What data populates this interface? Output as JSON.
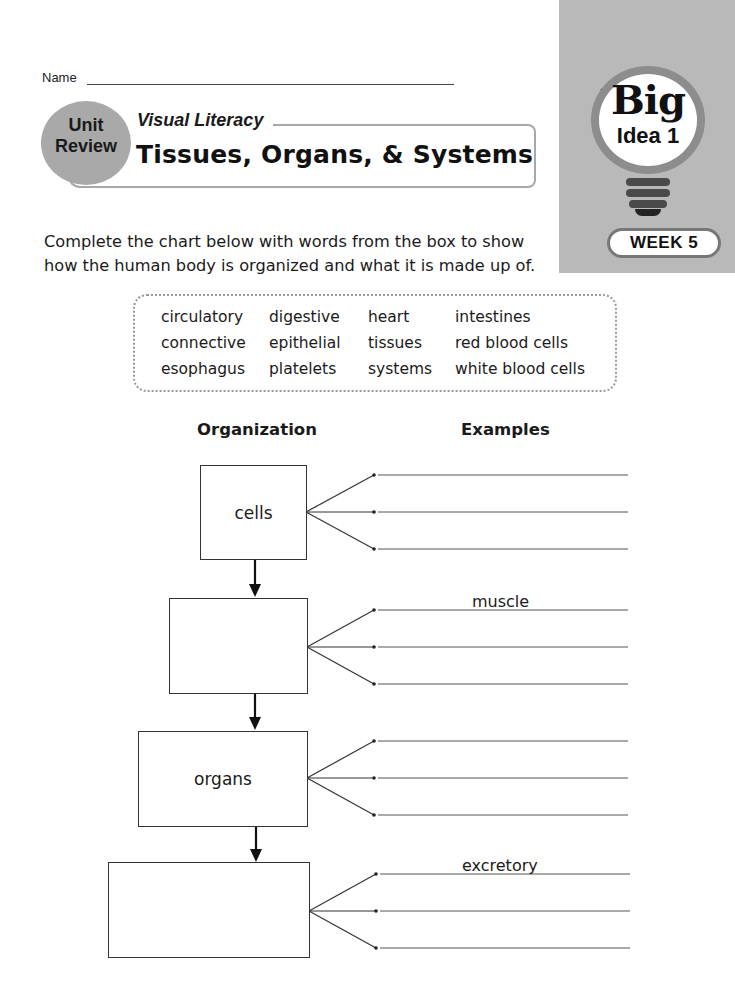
{
  "badge": {
    "series": "Daily Science",
    "big": "Big",
    "idea": "Idea 1",
    "week": "WEEK 5"
  },
  "header": {
    "name_label": "Name",
    "unit_line1": "Unit",
    "unit_line2": "Review",
    "section": "Visual Literacy",
    "title": "Tissues, Organs, & Systems"
  },
  "instructions": "Complete the chart below with words from the box to show how the human body is organized and what it is made up of.",
  "word_bank": {
    "columns": [
      [
        "circulatory",
        "connective",
        "esophagus"
      ],
      [
        "digestive",
        "epithelial",
        "platelets"
      ],
      [
        "heart",
        "tissues",
        "systems"
      ],
      [
        "intestines",
        "red blood cells",
        "white blood cells"
      ]
    ]
  },
  "chart": {
    "col_organization": "Organization",
    "col_examples": "Examples",
    "levels": [
      {
        "label": "cells",
        "examples": [
          "",
          "",
          ""
        ]
      },
      {
        "label": "",
        "examples": [
          "muscle",
          "",
          ""
        ]
      },
      {
        "label": "organs",
        "examples": [
          "",
          "",
          ""
        ]
      },
      {
        "label": "",
        "examples": [
          "excretory",
          "",
          ""
        ]
      }
    ]
  }
}
